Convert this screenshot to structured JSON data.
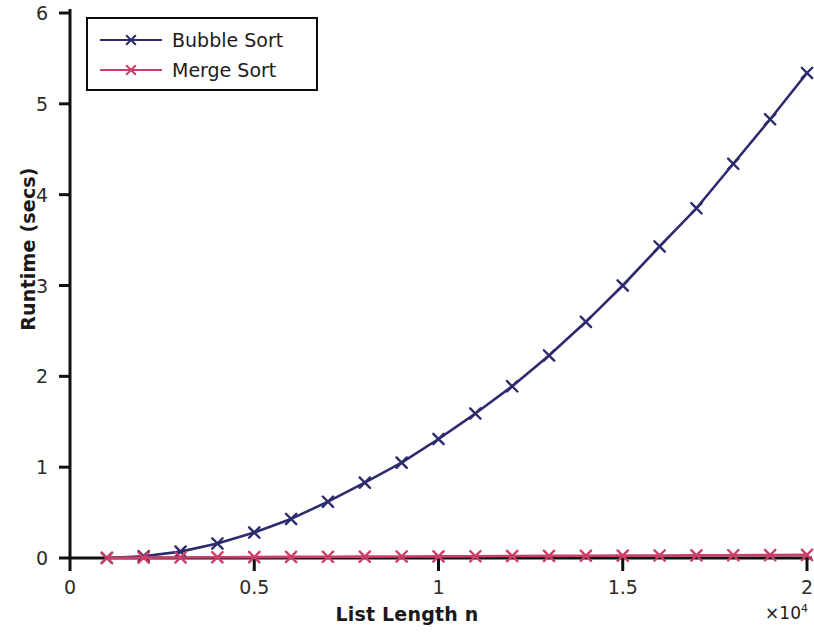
{
  "chart_data": {
    "type": "line",
    "title": "",
    "xlabel": "List Length n",
    "ylabel": "Runtime (secs)",
    "x_exponent_label": "×10",
    "x_exponent_power": "4",
    "xlim": [
      0,
      20000
    ],
    "ylim": [
      0,
      6
    ],
    "grid": false,
    "legend_position": "upper left",
    "xticks": [
      0,
      5000,
      10000,
      15000,
      20000
    ],
    "xtick_labels": [
      "0",
      "0.5",
      "1",
      "1.5",
      "2"
    ],
    "yticks": [
      0,
      1,
      2,
      3,
      4,
      5,
      6
    ],
    "ytick_labels": [
      "0",
      "1",
      "2",
      "3",
      "4",
      "5",
      "6"
    ],
    "x": [
      1000,
      2000,
      3000,
      4000,
      5000,
      6000,
      7000,
      8000,
      9000,
      10000,
      11000,
      12000,
      13000,
      14000,
      15000,
      16000,
      17000,
      18000,
      19000,
      20000
    ],
    "series": [
      {
        "name": "Bubble Sort",
        "color": "#2b2b6e",
        "marker": "x",
        "values": [
          0.0,
          0.02,
          0.07,
          0.16,
          0.28,
          0.43,
          0.62,
          0.83,
          1.05,
          1.31,
          1.59,
          1.89,
          2.23,
          2.6,
          3.0,
          3.43,
          3.85,
          4.34,
          4.83,
          5.34
        ]
      },
      {
        "name": "Merge Sort",
        "color": "#cc3f68",
        "marker": "x",
        "values": [
          0.002,
          0.004,
          0.006,
          0.008,
          0.01,
          0.012,
          0.013,
          0.015,
          0.017,
          0.018,
          0.02,
          0.022,
          0.023,
          0.025,
          0.026,
          0.028,
          0.029,
          0.031,
          0.032,
          0.034
        ]
      }
    ]
  },
  "legend": {
    "items": [
      {
        "label": "Bubble Sort"
      },
      {
        "label": "Merge Sort"
      }
    ]
  },
  "axes": {
    "ylabel": "Runtime (secs)",
    "xlabel": "List Length n",
    "exponent_prefix": "×10",
    "exponent_power": "4"
  },
  "colors": {
    "bubble_sort": "#2b2b6e",
    "merge_sort": "#cc3f68",
    "axis": "#111111",
    "background": "#ffffff"
  }
}
